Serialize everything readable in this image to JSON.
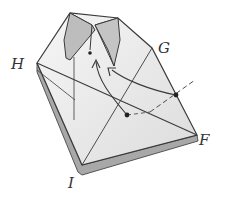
{
  "diagram": {
    "type": "origami-fold-step",
    "labels": {
      "H": "H",
      "G": "G",
      "F": "F",
      "I": "I"
    },
    "points": [
      {
        "name": "point-on-diagonal",
        "x": 127,
        "y": 115
      },
      {
        "name": "point-on-edge",
        "x": 176,
        "y": 95
      },
      {
        "name": "target-point",
        "x": 90,
        "y": 53
      }
    ],
    "arrows": [
      {
        "name": "fold-arrow-1",
        "from": "point-on-diagonal",
        "to": "target-point"
      },
      {
        "name": "fold-arrow-2",
        "from": "point-on-edge",
        "to": "target-point"
      }
    ],
    "colors": {
      "line": "#3a3a3a",
      "paper": "#f2f2f2",
      "shade": "#c8c8c8",
      "edge": "#9a9a9a"
    }
  }
}
